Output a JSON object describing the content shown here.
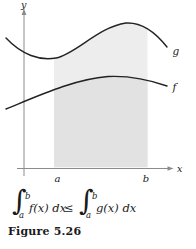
{
  "colors": {
    "curve": "#222222",
    "axis": "#8c8c8c",
    "region-light": "#ededed",
    "region-dark": "#e2e2e2",
    "text": "#1a1a1a",
    "bg": "#ffffff"
  },
  "graph": {
    "y_axis_label": "y",
    "x_axis_label": "x",
    "upper_curve_label": "g",
    "lower_curve_label": "f",
    "x_tick_a": "a",
    "x_tick_b": "b"
  },
  "formula": {
    "lhs": {
      "sign": "∫",
      "upper": "b",
      "lower": "a",
      "integrand": "f(x) dx"
    },
    "relation": "≤",
    "rhs": {
      "sign": "∫",
      "upper": "b",
      "lower": "a",
      "integrand": "g(x) dx"
    }
  },
  "caption": "Figure 5.26"
}
